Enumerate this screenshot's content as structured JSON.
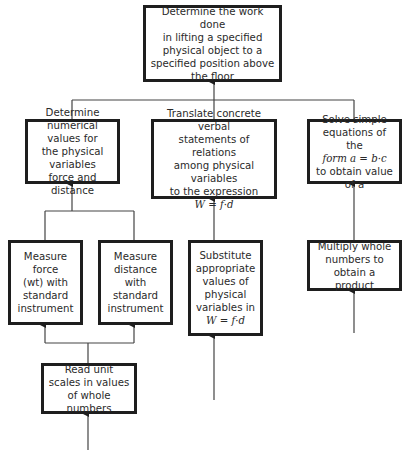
{
  "diagram": {
    "nodes": {
      "goal": {
        "text": "Determine the work done\nin lifting a specified\nphysical object to a\nspecified position above\nthe floor"
      },
      "numerical": {
        "text": "Determine\nnumerical values for\nthe physical variables\nforce and distance"
      },
      "translate": {
        "text": "Translate concrete verbal\nstatements of relations\namong physical variables\nto the expression",
        "formula": "W = f·d"
      },
      "solve": {
        "text": "Solve simple\nequations of the",
        "formula": "form   a = b·c",
        "tail": "to obtain value of a"
      },
      "measure_force": {
        "text": "Measure force\n(wt) with\nstandard\ninstrument"
      },
      "measure_distance": {
        "text": "Measure\ndistance\nwith\nstandard\ninstrument"
      },
      "substitute": {
        "text": "Substitute\nappropriate\nvalues of\nphysical\nvariables in",
        "formula": "W = f·d"
      },
      "multiply": {
        "text": "Multiply whole\nnumbers to\nobtain a product"
      },
      "read_scales": {
        "text": "Read unit\nscales in values\nof whole numbers"
      }
    },
    "edges": [
      [
        "numerical",
        "goal"
      ],
      [
        "translate",
        "goal"
      ],
      [
        "solve",
        "goal"
      ],
      [
        "measure_force",
        "numerical"
      ],
      [
        "measure_distance",
        "numerical"
      ],
      [
        "substitute",
        "translate"
      ],
      [
        "multiply",
        "solve"
      ],
      [
        "read_scales",
        "measure_force"
      ],
      [
        "read_scales",
        "measure_distance"
      ]
    ]
  }
}
